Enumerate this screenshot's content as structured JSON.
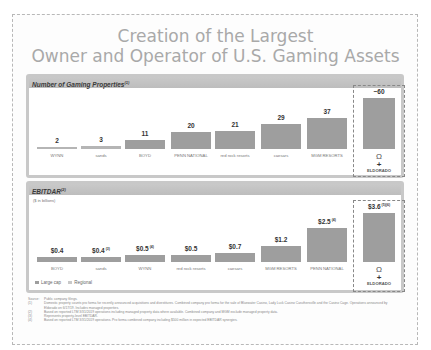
{
  "title": {
    "line1": "Creation of the Largest",
    "line2": "Owner and Operator of U.S. Gaming Assets"
  },
  "properties_panel": {
    "heading": "Number of Gaming Properties",
    "heading_note": "(1)"
  },
  "ebitdar_panel": {
    "heading": "EBITDAR",
    "heading_note": "(2)",
    "unit": "($ in billions)",
    "legend": {
      "large_cap": "Large cap",
      "regional": "Regional"
    }
  },
  "chart_data": [
    {
      "type": "bar",
      "title": "Number of Gaming Properties",
      "categories": [
        "Wynn",
        "Las Vegas Sands",
        "Boyd Gaming",
        "Penn National Gaming",
        "Red Rock Resorts",
        "Caesars",
        "MGM Resorts",
        "Combined (Eldorado + Caesars)"
      ],
      "values": [
        2,
        3,
        11,
        20,
        21,
        29,
        37,
        60
      ],
      "labels": [
        "2",
        "3",
        "11",
        "20",
        "21",
        "29",
        "37",
        "~60"
      ],
      "ylabel": "",
      "xlabel": "",
      "ylim": [
        0,
        65
      ],
      "highlight_last": true
    },
    {
      "type": "bar",
      "title": "EBITDAR",
      "subtitle": "($ in billions)",
      "categories": [
        "Boyd Gaming",
        "Las Vegas Sands",
        "Wynn",
        "Red Rock Resorts",
        "Caesars",
        "MGM Resorts",
        "Penn National Gaming",
        "Combined (Eldorado + Caesars)"
      ],
      "values": [
        0.4,
        0.4,
        0.5,
        0.5,
        0.7,
        1.2,
        2.5,
        3.6
      ],
      "labels": [
        "$0.4",
        "$0.4",
        "$0.5",
        "$0.5",
        "$0.7",
        "$1.2",
        "$2.5",
        "$3.6"
      ],
      "label_notes": [
        "",
        "(3)",
        "(4)",
        "",
        "",
        "",
        "(4)",
        "(5)(6)"
      ],
      "ylim": [
        0,
        4
      ],
      "legend": [
        "Large cap",
        "Regional"
      ],
      "legend_position": "bottom-left",
      "highlight_last": true
    }
  ],
  "prop_logos": [
    "WYNN",
    "sands",
    "BOYD",
    "PENN NATIONAL",
    "red rock resorts",
    "caesars",
    "MGM RESORTS",
    "ELDORADO"
  ],
  "ebit_logos": [
    "BOYD",
    "sands",
    "WYNN",
    "red rock resorts",
    "caesars",
    "MGM RESORTS",
    "PENN NATIONAL",
    "ELDORADO"
  ],
  "combined_symbol": "Ω",
  "combined_plus": "+",
  "footnotes": {
    "source_key": "Source:",
    "source": "Public company filings.",
    "items": [
      {
        "key": "(1)",
        "text": "Domestic property counts pro forma for recently announced acquisitions and divestitures. Combined company pro forma for the sale of Bluewater Casino, Lady Luck Casino Caruthersville and the Casino Cage. Operations announced by Eldorado on 6/17/19. Includes managed properties."
      },
      {
        "key": "(2)",
        "text": "Based on reported LTM 3/31/2019 operations including managed property data where available. Combined company and MGM exclude managed property data."
      },
      {
        "key": "(3)",
        "text": "Represents property-level EBITDAR."
      },
      {
        "key": "(4)",
        "text": "Based on reported LTM 3/31/2019 operations. Pro forma combined company including $500 million in expected EBITDAR synergies."
      }
    ]
  }
}
